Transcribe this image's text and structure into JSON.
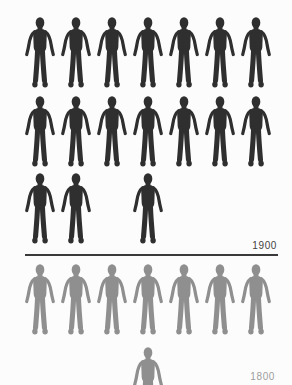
{
  "labels": {
    "top_year": "1900",
    "bottom_year": "1800"
  },
  "colors": {
    "background": "#fcfcfc",
    "figure_dark": "#2f2f2f",
    "figure_light": "#8f8f8f",
    "divider": "#3a3a3a",
    "label_top": "#3f3f3f",
    "label_bottom": "#9c9c9c"
  },
  "chart_data": {
    "type": "pictogram",
    "icon": "human-silhouette",
    "columns": 7,
    "legend": "none",
    "series": [
      {
        "name": "1900",
        "icon_count": 17,
        "rows": [
          [
            0,
            1,
            2,
            3,
            4,
            5,
            6
          ],
          [
            0,
            1,
            2,
            3,
            4,
            5,
            6
          ],
          [
            0,
            1,
            3
          ]
        ],
        "partial_icon": null,
        "color_key": "figure_dark",
        "position": "above-divider"
      },
      {
        "name": "1800",
        "icon_count": 7.5,
        "rows": [
          [
            0,
            1,
            2,
            3,
            4,
            5,
            6
          ]
        ],
        "partial_icon": {
          "column": 3,
          "visible_fraction": 0.52,
          "clipped_by": "bottom-edge"
        },
        "color_key": "figure_light",
        "position": "below-divider"
      }
    ]
  }
}
